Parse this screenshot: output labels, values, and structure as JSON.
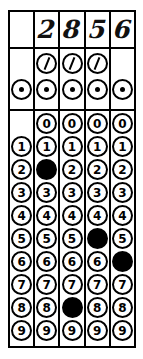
{
  "form": {
    "name": "grid-in-answer-grid",
    "columns": 5,
    "ink_color": "#000000",
    "paper_color": "#ffffff"
  },
  "answer_row": {
    "label": "handwritten-answer",
    "cells": [
      "",
      "2",
      "8",
      "5",
      "6"
    ],
    "entered_value": "2856"
  },
  "symbol_rows": [
    {
      "symbol": "/",
      "icon": "fraction-bar-icon",
      "present_in_columns": [
        false,
        true,
        true,
        true,
        false
      ],
      "marked_in_columns": [
        false,
        false,
        false,
        false,
        false
      ]
    },
    {
      "symbol": ".",
      "icon": "decimal-point-icon",
      "present_in_columns": [
        true,
        true,
        true,
        true,
        true
      ],
      "marked_in_columns": [
        false,
        false,
        false,
        false,
        false
      ]
    }
  ],
  "digit_columns": [
    {
      "index": 1,
      "digits": [
        "1",
        "2",
        "3",
        "4",
        "5",
        "6",
        "7",
        "8",
        "9"
      ],
      "has_zero": false,
      "marked": null
    },
    {
      "index": 2,
      "digits": [
        "0",
        "1",
        "2",
        "3",
        "4",
        "5",
        "6",
        "7",
        "8",
        "9"
      ],
      "has_zero": true,
      "marked": "2"
    },
    {
      "index": 3,
      "digits": [
        "0",
        "1",
        "2",
        "3",
        "4",
        "5",
        "6",
        "7",
        "8",
        "9"
      ],
      "has_zero": true,
      "marked": "8"
    },
    {
      "index": 4,
      "digits": [
        "0",
        "1",
        "2",
        "3",
        "4",
        "5",
        "6",
        "7",
        "8",
        "9"
      ],
      "has_zero": true,
      "marked": "5"
    },
    {
      "index": 5,
      "digits": [
        "0",
        "1",
        "2",
        "3",
        "4",
        "5",
        "6",
        "7",
        "8",
        "9"
      ],
      "has_zero": true,
      "marked": "6"
    }
  ]
}
